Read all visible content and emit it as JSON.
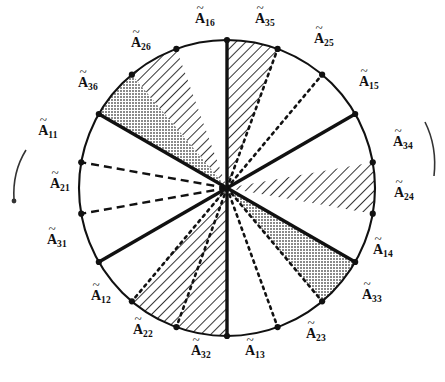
{
  "figure": {
    "circle": {
      "cx": 227,
      "cy": 188,
      "r": 148
    },
    "colors": {
      "stroke": "#111111",
      "shade_gray": "#8f8f8f",
      "background": "#ffffff",
      "hatch": "#111111"
    },
    "label_count": 18,
    "sector_count": 18,
    "sector_span_degrees": 20
  },
  "chart_data": {
    "type": "pie",
    "title": "",
    "xlabel": "",
    "ylabel": "",
    "legend": [],
    "grid": false,
    "categories": [
      "A16",
      "A35",
      "A25",
      "A15",
      "A34",
      "A24",
      "A14",
      "A33",
      "A23",
      "A13",
      "A32",
      "A22",
      "A12",
      "A31",
      "A21",
      "A11",
      "A36",
      "A26"
    ],
    "values": [
      20,
      20,
      20,
      20,
      20,
      20,
      20,
      20,
      20,
      20,
      20,
      20,
      20,
      20,
      20,
      20,
      20,
      20
    ]
  },
  "labels": [
    {
      "id": "A16",
      "base": "A",
      "sub": "16",
      "x": 205,
      "y": 20,
      "angle": 90
    },
    {
      "id": "A35",
      "base": "A",
      "sub": "35",
      "x": 265,
      "y": 20,
      "angle": 70
    },
    {
      "id": "A25",
      "base": "A",
      "sub": "25",
      "x": 324,
      "y": 40,
      "angle": 50
    },
    {
      "id": "A15",
      "base": "A",
      "sub": "15",
      "x": 369,
      "y": 83,
      "angle": 30
    },
    {
      "id": "A34",
      "base": "A",
      "sub": "34",
      "x": 403,
      "y": 143,
      "angle": 10
    },
    {
      "id": "A24",
      "base": "A",
      "sub": "24",
      "x": 404,
      "y": 194,
      "angle": -10
    },
    {
      "id": "A14",
      "base": "A",
      "sub": "14",
      "x": 383,
      "y": 251,
      "angle": -30
    },
    {
      "id": "A33",
      "base": "A",
      "sub": "33",
      "x": 372,
      "y": 296,
      "angle": -50
    },
    {
      "id": "A23",
      "base": "A",
      "sub": "23",
      "x": 316,
      "y": 335,
      "angle": -70
    },
    {
      "id": "A13",
      "base": "A",
      "sub": "13",
      "x": 255,
      "y": 352,
      "angle": -90
    },
    {
      "id": "A32",
      "base": "A",
      "sub": "32",
      "x": 201,
      "y": 352,
      "angle": -110
    },
    {
      "id": "A22",
      "base": "A",
      "sub": "22",
      "x": 143,
      "y": 331,
      "angle": -130
    },
    {
      "id": "A12",
      "base": "A",
      "sub": "12",
      "x": 101,
      "y": 297,
      "angle": -150
    },
    {
      "id": "A31",
      "base": "A",
      "sub": "31",
      "x": 57,
      "y": 241,
      "angle": -170
    },
    {
      "id": "A21",
      "base": "A",
      "sub": "21",
      "x": 60,
      "y": 185,
      "angle": 170
    },
    {
      "id": "A11",
      "base": "A",
      "sub": "11",
      "x": 48,
      "y": 132,
      "angle": 150
    },
    {
      "id": "A36",
      "base": "A",
      "sub": "36",
      "x": 88,
      "y": 84,
      "angle": 130
    },
    {
      "id": "A26",
      "base": "A",
      "sub": "26",
      "x": 141,
      "y": 44,
      "angle": 110
    }
  ],
  "sectors": [
    {
      "name": "sector-0",
      "from": 90,
      "to": 70,
      "fill": "hatch"
    },
    {
      "name": "sector-1",
      "from": 70,
      "to": 50,
      "fill": "none"
    },
    {
      "name": "sector-2",
      "from": 50,
      "to": 30,
      "fill": "none"
    },
    {
      "name": "sector-3",
      "from": 30,
      "to": 10,
      "fill": "none"
    },
    {
      "name": "sector-4",
      "from": 10,
      "to": -10,
      "fill": "hatch"
    },
    {
      "name": "sector-5",
      "from": -10,
      "to": -30,
      "fill": "none"
    },
    {
      "name": "sector-6",
      "from": -30,
      "to": -50,
      "fill": "gray"
    },
    {
      "name": "sector-7",
      "from": -50,
      "to": -70,
      "fill": "none"
    },
    {
      "name": "sector-8",
      "from": -70,
      "to": -90,
      "fill": "none"
    },
    {
      "name": "sector-9",
      "from": -90,
      "to": -110,
      "fill": "hatch"
    },
    {
      "name": "sector-10",
      "from": -110,
      "to": -130,
      "fill": "hatch"
    },
    {
      "name": "sector-11",
      "from": -130,
      "to": -150,
      "fill": "none"
    },
    {
      "name": "sector-12",
      "from": -150,
      "to": -170,
      "fill": "none"
    },
    {
      "name": "sector-13",
      "from": 170,
      "to": 150,
      "fill": "none"
    },
    {
      "name": "sector-14",
      "from": 150,
      "to": 130,
      "fill": "gray"
    },
    {
      "name": "sector-15",
      "from": 130,
      "to": 110,
      "fill": "hatch"
    },
    {
      "name": "sector-16",
      "from": 110,
      "to": 90,
      "fill": "none"
    }
  ],
  "radii": [
    {
      "name": "radius-A16",
      "angle": 90,
      "style": "solid-thick"
    },
    {
      "name": "radius-A35",
      "angle": 70,
      "style": "dotted"
    },
    {
      "name": "radius-A25",
      "angle": 50,
      "style": "dotted"
    },
    {
      "name": "radius-A15",
      "angle": 30,
      "style": "solid-thick"
    },
    {
      "name": "radius-A34",
      "angle": 10,
      "style": "none"
    },
    {
      "name": "radius-A24",
      "angle": -10,
      "style": "none"
    },
    {
      "name": "radius-A14",
      "angle": -30,
      "style": "solid-thick"
    },
    {
      "name": "radius-A33",
      "angle": -50,
      "style": "dotted"
    },
    {
      "name": "radius-A23",
      "angle": -70,
      "style": "dotted"
    },
    {
      "name": "radius-A13",
      "angle": -90,
      "style": "solid-thick"
    },
    {
      "name": "radius-A32",
      "angle": -110,
      "style": "dotted"
    },
    {
      "name": "radius-A22",
      "angle": -130,
      "style": "dotted"
    },
    {
      "name": "radius-A12",
      "angle": -150,
      "style": "solid-thick"
    },
    {
      "name": "radius-A31",
      "angle": -170,
      "style": "dashed"
    },
    {
      "name": "radius-A21",
      "angle": 170,
      "style": "dashed"
    },
    {
      "name": "radius-A11",
      "angle": 150,
      "style": "solid-thick"
    },
    {
      "name": "radius-A36",
      "angle": 130,
      "style": "none"
    },
    {
      "name": "radius-A26",
      "angle": 110,
      "style": "none"
    }
  ],
  "annotations": {
    "left_arc": {
      "name": "left-rotation-arrow",
      "description": "curved arrow at left margin"
    },
    "right_arc": {
      "name": "right-rotation-arrow",
      "description": "curved arc at right margin"
    }
  }
}
